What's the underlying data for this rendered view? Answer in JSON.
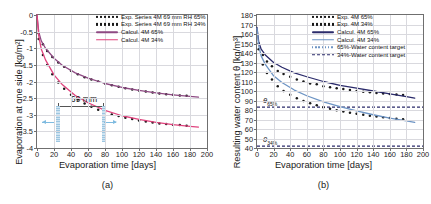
{
  "figure": {
    "panel_a_tag": "(a)",
    "panel_b_tag": "(b)"
  },
  "chart_data": [
    {
      "type": "line",
      "panel": "(a)",
      "title": "",
      "xlabel": "Evaporation time [days]",
      "ylabel": "Evaporation at one side [kg/m²]",
      "xlim": [
        0,
        200
      ],
      "ylim": [
        -4,
        0
      ],
      "xticks": [
        0,
        20,
        40,
        60,
        80,
        100,
        120,
        140,
        160,
        180,
        200
      ],
      "yticks": [
        0,
        -0.5,
        -1,
        -1.5,
        -2,
        -2.5,
        -3,
        -3.5,
        -4
      ],
      "ytick_labels": [
        "0",
        "-0.5",
        "-1",
        "-1.5",
        "-2",
        "-2.5",
        "-3",
        "-3.5",
        "-4"
      ],
      "grid": true,
      "legend_position": "upper right",
      "annotation": "69 mm",
      "series": [
        {
          "name": "Exp. Series 4M 69 mm RH 65%",
          "style": "dots",
          "color": "#1a1a1a",
          "x": [
            2,
            7,
            12,
            18,
            25,
            32,
            40,
            48,
            56,
            64,
            72,
            80,
            88,
            96,
            104,
            112,
            120,
            128,
            136,
            144,
            152,
            160,
            168,
            176
          ],
          "y": [
            -0.55,
            -0.88,
            -1.08,
            -1.26,
            -1.43,
            -1.56,
            -1.68,
            -1.78,
            -1.87,
            -1.94,
            -2.0,
            -2.06,
            -2.11,
            -2.16,
            -2.2,
            -2.24,
            -2.27,
            -2.3,
            -2.33,
            -2.36,
            -2.38,
            -2.4,
            -2.42,
            -2.43
          ]
        },
        {
          "name": "Exp. Series 4M 69 mm RH 34%",
          "style": "dots",
          "color": "#1a1a1a",
          "x": [
            2,
            7,
            12,
            18,
            25,
            32,
            40,
            48,
            56,
            64,
            72,
            80,
            88,
            96,
            104,
            112,
            120,
            128,
            136,
            144,
            152,
            160,
            168,
            176
          ],
          "y": [
            -0.72,
            -1.2,
            -1.5,
            -1.78,
            -2.03,
            -2.22,
            -2.4,
            -2.54,
            -2.66,
            -2.76,
            -2.85,
            -2.92,
            -2.99,
            -3.04,
            -3.09,
            -3.13,
            -3.17,
            -3.2,
            -3.23,
            -3.26,
            -3.28,
            -3.3,
            -3.31,
            -3.33
          ]
        },
        {
          "name": "Calcul. 4M 65%",
          "style": "solid",
          "color": "#8e4a83",
          "x": [
            0,
            2,
            5,
            10,
            20,
            30,
            45,
            60,
            80,
            100,
            120,
            140,
            160,
            180,
            190
          ],
          "y": [
            0,
            -0.5,
            -0.78,
            -1.0,
            -1.3,
            -1.52,
            -1.74,
            -1.9,
            -2.06,
            -2.18,
            -2.27,
            -2.34,
            -2.4,
            -2.45,
            -2.47
          ]
        },
        {
          "name": "Calcul. 4M 34%",
          "style": "solid",
          "color": "#e0447e",
          "x": [
            0,
            2,
            5,
            10,
            20,
            30,
            45,
            60,
            80,
            100,
            120,
            140,
            160,
            180,
            190
          ],
          "y": [
            0,
            -0.62,
            -1.02,
            -1.35,
            -1.8,
            -2.1,
            -2.42,
            -2.64,
            -2.87,
            -3.03,
            -3.14,
            -3.23,
            -3.3,
            -3.35,
            -3.37
          ]
        }
      ],
      "legend": [
        {
          "label": "Exp. Series 4M 69 mm RH 65%",
          "style": "dots",
          "color": "#1a1a1a"
        },
        {
          "label": "Exp. Series 4M 69 mm RH 34%",
          "style": "dots",
          "color": "#1a1a1a"
        },
        {
          "label": "Calcul. 4M 65%",
          "style": "solid",
          "color": "#8e4a83"
        },
        {
          "label": "Calcul. 4M 34%",
          "style": "solid",
          "color": "#e0447e"
        }
      ]
    },
    {
      "type": "line",
      "panel": "(b)",
      "title": "",
      "xlabel": "Evaporation time [days]",
      "ylabel": "Resulting water content θ [kg/m³]",
      "xlim": [
        0,
        200
      ],
      "ylim": [
        40,
        180
      ],
      "xticks": [
        0,
        20,
        40,
        60,
        80,
        100,
        120,
        140,
        160,
        180,
        200
      ],
      "yticks": [
        40,
        50,
        60,
        70,
        80,
        90,
        100,
        110,
        120,
        130,
        140,
        150,
        160,
        170,
        180
      ],
      "grid": true,
      "legend_position": "upper right",
      "annotations": [
        {
          "text": "θ",
          "sub": "65%",
          "value": 88
        },
        {
          "text": "θ",
          "sub": "34%",
          "value": 47
        }
      ],
      "targets": [
        {
          "name": "65%-Water content target",
          "value": 83,
          "color": "#2b2b6b"
        },
        {
          "name": "34%-Water content target",
          "value": 42,
          "color": "#2b2b6b"
        }
      ],
      "series": [
        {
          "name": "Exp. 4M 65%",
          "style": "dots",
          "color": "#1a1a1a",
          "x": [
            2,
            7,
            12,
            18,
            25,
            32,
            40,
            48,
            56,
            64,
            72,
            80,
            88,
            96,
            104,
            112,
            120,
            128,
            136,
            144,
            152,
            160,
            168,
            176
          ],
          "y": [
            150,
            138,
            131,
            126,
            121,
            118,
            115,
            112,
            110,
            108,
            107,
            105,
            104,
            103,
            102,
            101,
            100,
            99.3,
            98.6,
            98,
            97.4,
            96.8,
            96.2,
            95.8
          ]
        },
        {
          "name": "Exp. 4M 34%",
          "style": "dots",
          "color": "#1a1a1a",
          "x": [
            2,
            7,
            12,
            18,
            25,
            32,
            40,
            48,
            56,
            64,
            72,
            80,
            88,
            96,
            104,
            112,
            120,
            128,
            136,
            144,
            152,
            160,
            168,
            176
          ],
          "y": [
            144,
            128,
            119,
            112,
            105,
            100,
            96,
            92.5,
            89.5,
            87,
            85,
            83,
            81.3,
            79.8,
            78.4,
            77.2,
            76,
            75,
            74,
            73.1,
            72.3,
            71.5,
            70.8,
            70.2
          ]
        },
        {
          "name": "Calcul. 4M 65%",
          "style": "solid",
          "color": "#2b2b6b",
          "x": [
            0,
            2,
            5,
            10,
            20,
            30,
            45,
            60,
            80,
            100,
            120,
            140,
            160,
            180,
            190
          ],
          "y": [
            167,
            152,
            144,
            138,
            130,
            125,
            119,
            115,
            110,
            106,
            103,
            100,
            97,
            94,
            92.5
          ]
        },
        {
          "name": "Calcul. 4M 34%",
          "style": "solid",
          "color": "#6d94c4",
          "x": [
            0,
            2,
            5,
            10,
            20,
            30,
            45,
            60,
            80,
            100,
            120,
            140,
            160,
            180,
            190
          ],
          "y": [
            166,
            148,
            137,
            128,
            116,
            109,
            101,
            95,
            88.5,
            83.5,
            79,
            75,
            71.5,
            68.5,
            67
          ]
        }
      ],
      "legend": [
        {
          "label": "Exp. 4M 65%",
          "style": "dots",
          "color": "#1a1a1a"
        },
        {
          "label": "Exp. 4M 34%",
          "style": "dots",
          "color": "#1a1a1a"
        },
        {
          "label": "Calcul. 4M 65%",
          "style": "solid",
          "color": "#2b2b6b"
        },
        {
          "label": "Calcul. 4M 34%",
          "style": "solid",
          "color": "#6d94c4"
        },
        {
          "label": "65%-Water content target",
          "style": "dotted",
          "color": "#6d94c4"
        },
        {
          "label": "34%-Water content target",
          "style": "dashed",
          "color": "#2b2b6b"
        }
      ]
    }
  ]
}
